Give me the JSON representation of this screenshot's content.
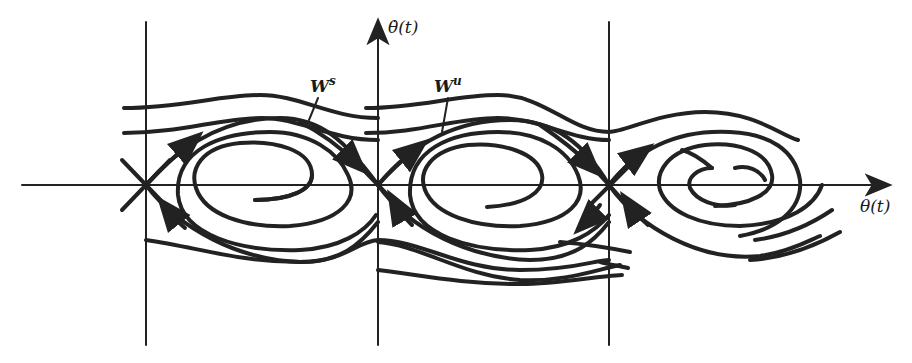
{
  "figure": {
    "type": "phase portrait",
    "y_axis_label": "θ̇(t)",
    "x_axis_label": "θ(t)",
    "stable_manifold_label": "W",
    "stable_manifold_sup": "s",
    "unstable_manifold_label": "W",
    "unstable_manifold_sup": "u",
    "saddle_points": 3,
    "spiral_cells": 3,
    "line_color": "#222222",
    "background": "#ffffff"
  }
}
